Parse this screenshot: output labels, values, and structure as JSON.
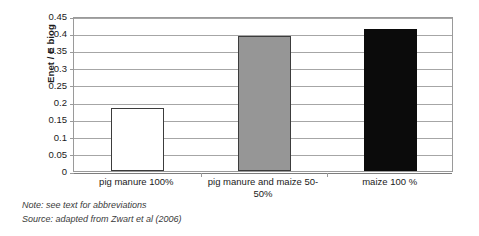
{
  "chart_data": {
    "type": "bar",
    "title": "",
    "xlabel": "",
    "ylabel": "Enet / E biog",
    "ylim": [
      0,
      0.45
    ],
    "grid": true,
    "legend": "none",
    "categories": [
      "pig manure 100%",
      "pig manure and maize 50-50%",
      "maize 100 %"
    ],
    "values": [
      0.182,
      0.392,
      0.412
    ],
    "bar_colors": [
      "#ffffff",
      "#969696",
      "#0b0b0b"
    ],
    "y_ticks": [
      "0",
      "0.05",
      "0.1",
      "0.15",
      "0.2",
      "0.25",
      "0.3",
      "0.35",
      "0.4",
      "0.45"
    ],
    "y_tick_values": [
      0,
      0.05,
      0.1,
      0.15,
      0.2,
      0.25,
      0.3,
      0.35,
      0.4,
      0.45
    ]
  },
  "footnotes": {
    "note": "Note: see text for abbreviations",
    "source": "Source: adapted from Zwart et al (2006)"
  },
  "colors": {
    "gridline": "#a6a6a6",
    "axis": "#9a9a9a",
    "bar_outline": "#3c3c3c",
    "text": "#1a1a1a"
  }
}
